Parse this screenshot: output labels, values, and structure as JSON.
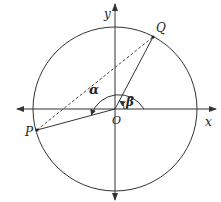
{
  "diagram": {
    "labels": {
      "y_axis": "y",
      "x_axis": "x",
      "origin": "O",
      "point_q": "Q",
      "point_p": "P",
      "angle_alpha": "α",
      "angle_beta": "β"
    },
    "colors": {
      "stroke": "#333333",
      "background": "#ffffff"
    }
  }
}
